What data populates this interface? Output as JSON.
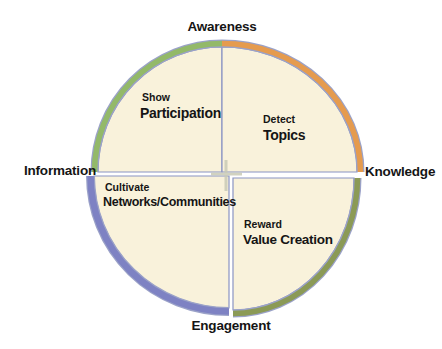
{
  "diagram": {
    "axis_labels": {
      "top": "Awareness",
      "right": "Knowledge",
      "bottom": "Engagement",
      "left": "Information"
    },
    "quadrants": [
      {
        "position": "top-left",
        "action": "Show",
        "label": "Participation",
        "arc_color": "#93b969"
      },
      {
        "position": "top-right",
        "action": "Detect",
        "label": "Topics",
        "arc_color": "#e59b4e"
      },
      {
        "position": "bottom-left",
        "action": "Cultivate",
        "label": "Networks/Communities",
        "arc_color": "#7e82c3"
      },
      {
        "position": "bottom-right",
        "action": "Reward",
        "label": "Value Creation",
        "arc_color": "#8b9a56"
      }
    ],
    "colors": {
      "quadrant_fill": "#f9f2db",
      "divider": "#8a94c4",
      "arc_outline": "#9ba2c8",
      "center_mark": "#c9cbb6",
      "background": "#ffffff",
      "text": "#151515"
    }
  }
}
